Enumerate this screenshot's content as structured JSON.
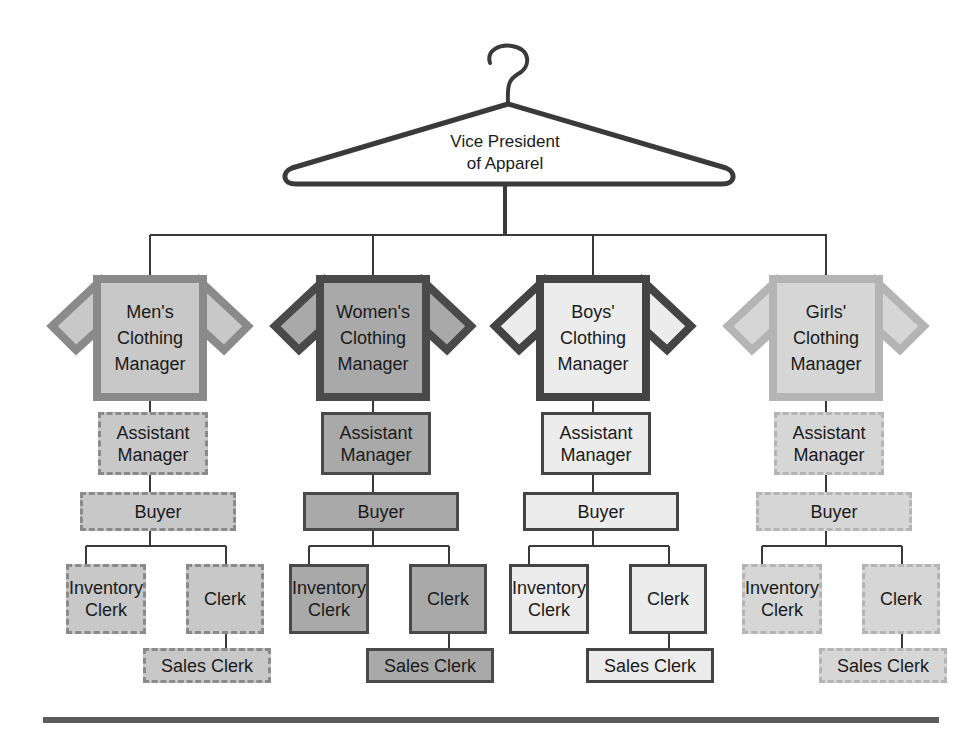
{
  "title": "Vice President\nof Apparel",
  "colors": {
    "line": "#3a3a3a",
    "mens": {
      "fill": "#c8c8c8",
      "border": "#8a8a8a"
    },
    "womens": {
      "fill": "#a9a9a9",
      "border": "#4a4a4a"
    },
    "boys": {
      "fill": "#ececec",
      "border": "#444444"
    },
    "girls": {
      "fill": "#d6d6d6",
      "border": "#b4b4b4"
    }
  },
  "departments": [
    {
      "key": "mens",
      "manager": "Men's\nClothing\nManager",
      "assistant": "Assistant\nManager",
      "buyer": "Buyer",
      "inventory_clerk": "Inventory\nClerk",
      "clerk": "Clerk",
      "sales_clerk": "Sales Clerk"
    },
    {
      "key": "womens",
      "manager": "Women's\nClothing\nManager",
      "assistant": "Assistant\nManager",
      "buyer": "Buyer",
      "inventory_clerk": "Inventory\nClerk",
      "clerk": "Clerk",
      "sales_clerk": "Sales Clerk"
    },
    {
      "key": "boys",
      "manager": "Boys'\nClothing\nManager",
      "assistant": "Assistant\nManager",
      "buyer": "Buyer",
      "inventory_clerk": "Inventory\nClerk",
      "clerk": "Clerk",
      "sales_clerk": "Sales Clerk"
    },
    {
      "key": "girls",
      "manager": "Girls'\nClothing\nManager",
      "assistant": "Assistant\nManager",
      "buyer": "Buyer",
      "inventory_clerk": "Inventory\nClerk",
      "clerk": "Clerk",
      "sales_clerk": "Sales Clerk"
    }
  ]
}
